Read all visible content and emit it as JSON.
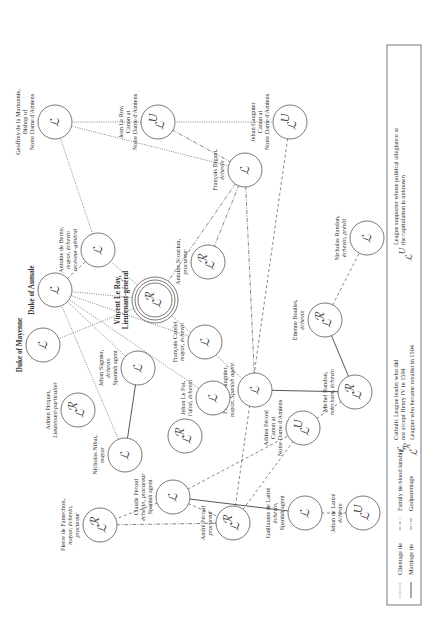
{
  "diagram": {
    "orientation": "rotated 90 degrees clockwise (text reads bottom-to-top)",
    "nodes": [
      {
        "id": "geoffrey",
        "label": [
          "Geoffrey de la Martonnie,",
          "Bishop of",
          "Notre Dame d'Amiens"
        ],
        "symbol": "L",
        "x": 55,
        "y": 122
      },
      {
        "id": "jean_le_roy",
        "label": [
          "Jean Le Roy,",
          "Canon at",
          "Notre Dame d'Amiens"
        ],
        "symbol": "LU",
        "x": 158,
        "y": 122
      },
      {
        "id": "jehan_gaugnier",
        "label": [
          "Jehan Gaugnier",
          "Canon at",
          "Notre Dame d'Amiens"
        ],
        "symbol": "LU",
        "x": 290,
        "y": 122
      },
      {
        "id": "antoine_berny",
        "label": [
          "Antoine de Berny,",
          "mayor, échevin",
          "receveur-général"
        ],
        "symbol": "L",
        "x": 98,
        "y": 250
      },
      {
        "id": "francois_bigant",
        "label": [
          "François Bigant,",
          "échevin"
        ],
        "symbol": "L",
        "x": 245,
        "y": 170
      },
      {
        "id": "duke_aumale",
        "label": [
          "Duke of Aumale"
        ],
        "symbol": "L",
        "x": 55,
        "y": 290,
        "bold": true
      },
      {
        "id": "duke_mayenne",
        "label": [
          "Duke of Mayenne"
        ],
        "symbol": "L",
        "x": 43,
        "y": 345,
        "bold": true
      },
      {
        "id": "vincent_le_roy",
        "label": [
          "Vincent Le Roy,",
          "Lieutenant-général"
        ],
        "symbol": "LR",
        "x": 155,
        "y": 300,
        "bold": true,
        "concentric": true
      },
      {
        "id": "antoine_scourion",
        "label": [
          "Antoine Scourion,",
          "procureur"
        ],
        "symbol": "LR",
        "x": 208,
        "y": 262
      },
      {
        "id": "francois_catelet",
        "label": [
          "François Catelet",
          "mayor, échevin"
        ],
        "symbol": "L",
        "x": 205,
        "y": 342
      },
      {
        "id": "francois_gaugnier",
        "label": [
          "François Gaugnier,",
          "mayor, Spanish agent"
        ],
        "symbol": "L",
        "x": 255,
        "y": 390
      },
      {
        "id": "etienne_boullet",
        "label": [
          "Etienne Boullet,",
          "échevin"
        ],
        "symbol": "LR",
        "x": 325,
        "y": 320
      },
      {
        "id": "nicholas_randon",
        "label": [
          "Nicholas Randon,",
          "échevin, prévôt"
        ],
        "symbol": "L",
        "x": 367,
        "y": 238
      },
      {
        "id": "michel_randon",
        "label": [
          "Michel Randon,",
          "merchant, échevin"
        ],
        "symbol": "LR",
        "x": 355,
        "y": 392
      },
      {
        "id": "jehan_sagnier",
        "label": [
          "Jehan Sagnier,",
          "échevin",
          "Spanish agent"
        ],
        "symbol": "L",
        "x": 138,
        "y": 368
      },
      {
        "id": "adrien_picquet",
        "label": [
          "Adrien Picquet,",
          "Lieutenant-particulier"
        ],
        "symbol": "LR",
        "x": 78,
        "y": 410
      },
      {
        "id": "nicholas_nibat",
        "label": [
          "Nicholas Nibat,",
          "mayor"
        ],
        "symbol": "L",
        "x": 125,
        "y": 455
      },
      {
        "id": "sagnier_r",
        "label": [],
        "symbol": "LR",
        "x": 185,
        "y": 436
      },
      {
        "id": "jehan_le_pot",
        "label": [
          "Jehan Le Pot,",
          "l'aîné, échevin"
        ],
        "symbol": "L",
        "x": 213,
        "y": 398
      },
      {
        "id": "adrien_pecoul",
        "label": [
          "Adrien Pécoul",
          "Canon at",
          "Notre Dame d'Amiens"
        ],
        "symbol": "LU",
        "x": 303,
        "y": 428
      },
      {
        "id": "claude_pecoul",
        "label": [
          "Claude Pécoul",
          "échevin, procureur",
          "Spanish agent"
        ],
        "symbol": "L",
        "x": 173,
        "y": 497
      },
      {
        "id": "pierre_famechon",
        "label": [
          "Pierre de Famechon,",
          "mayor, échevin,",
          "procureur"
        ],
        "symbol": "LR",
        "x": 100,
        "y": 525
      },
      {
        "id": "andre_pecoul",
        "label": [
          "André Pécoul",
          "procureur"
        ],
        "symbol": "LR",
        "x": 233,
        "y": 523
      },
      {
        "id": "guillaume_lattre",
        "label": [
          "Guillaume de Lattré",
          "échevin,",
          "Spanish agent"
        ],
        "symbol": "L",
        "x": 305,
        "y": 513
      },
      {
        "id": "jehan_lattre",
        "label": [
          "Jehan de Lattré",
          "échevin"
        ],
        "symbol": "LU",
        "x": 363,
        "y": 513
      }
    ],
    "edges": [
      {
        "from": "geoffrey",
        "to": "jean_le_roy",
        "type": "clientage"
      },
      {
        "from": "jean_le_roy",
        "to": "jehan_gaugnier",
        "type": "clientage"
      },
      {
        "from": "geoffrey",
        "to": "francois_bigant",
        "type": "clientage"
      },
      {
        "from": "geoffrey",
        "to": "antoine_berny",
        "type": "clientage"
      },
      {
        "from": "jean_le_roy",
        "to": "francois_bigant",
        "type": "godparentage"
      },
      {
        "from": "jehan_gaugnier",
        "to": "andre_pecoul",
        "type": "family"
      },
      {
        "from": "duke_aumale",
        "to": "antoine_berny",
        "type": "family"
      },
      {
        "from": "duke_aumale",
        "to": "vincent_le_roy",
        "type": "clientage"
      },
      {
        "from": "duke_mayenne",
        "to": "vincent_le_roy",
        "type": "clientage"
      },
      {
        "from": "duke_aumale",
        "to": "jehan_sagnier",
        "type": "clientage"
      },
      {
        "from": "duke_aumale",
        "to": "francois_catelet",
        "type": "clientage"
      },
      {
        "from": "duke_aumale",
        "to": "nicholas_nibat",
        "type": "clientage"
      },
      {
        "from": "duke_aumale",
        "to": "jehan_le_pot",
        "type": "clientage"
      },
      {
        "from": "antoine_berny",
        "to": "francois_gaugnier",
        "type": "clientage"
      },
      {
        "from": "francois_bigant",
        "to": "vincent_le_roy",
        "type": "godparentage"
      },
      {
        "from": "francois_bigant",
        "to": "antoine_scourion",
        "type": "godparentage"
      },
      {
        "from": "francois_bigant",
        "to": "francois_gaugnier",
        "type": "godparentage"
      },
      {
        "from": "francois_gaugnier",
        "to": "michel_randon",
        "type": "marriage"
      },
      {
        "from": "michel_randon",
        "to": "etienne_boullet",
        "type": "marriage"
      },
      {
        "from": "etienne_boullet",
        "to": "nicholas_randon",
        "type": "family"
      },
      {
        "from": "jehan_sagnier",
        "to": "nicholas_nibat",
        "type": "marriage"
      },
      {
        "from": "claude_pecoul",
        "to": "guillaume_lattre",
        "type": "marriage"
      },
      {
        "from": "guillaume_lattre",
        "to": "jehan_lattre",
        "type": "family"
      },
      {
        "from": "claude_pecoul",
        "to": "pierre_famechon",
        "type": "family"
      },
      {
        "from": "claude_pecoul",
        "to": "andre_pecoul",
        "type": "family"
      },
      {
        "from": "claude_pecoul",
        "to": "adrien_pecoul",
        "type": "family"
      },
      {
        "from": "andre_pecoul",
        "to": "adrien_pecoul",
        "type": "family"
      },
      {
        "from": "pierre_famechon",
        "to": "andre_pecoul",
        "type": "godparentage"
      },
      {
        "from": "adrien_pecoul",
        "to": "michel_randon",
        "type": "family"
      }
    ],
    "legend": {
      "lines": [
        {
          "type": "clientage",
          "label": "Clientage tie"
        },
        {
          "type": "marriage",
          "label": "Marriage tie"
        },
        {
          "type": "family",
          "label": "Family tie blood kinship"
        },
        {
          "type": "godparentage",
          "label": "Godparentage"
        }
      ],
      "symbols": [
        {
          "symbol": "L",
          "label": [
            "Catholic League leader who did",
            "not accept Henry IV in 1594"
          ]
        },
        {
          "symbol": "LR",
          "label": [
            "Leaguer who became royalist in 1594"
          ]
        },
        {
          "symbol": "LU",
          "label": [
            "League supporter whose political allegiance at",
            "the capitulation is unknown"
          ]
        }
      ]
    }
  }
}
